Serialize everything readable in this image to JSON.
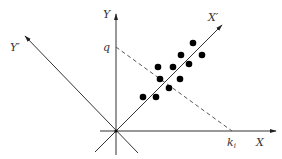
{
  "diagram": {
    "title": "",
    "colors": {
      "axis": "#333333",
      "points": "#000000",
      "dashed": "#555555",
      "background": "#ffffff"
    },
    "labels": {
      "y_axis": "Y",
      "x_axis": "X",
      "x_prime_axis": "X′",
      "y_prime_axis": "Y′",
      "q_label": "q",
      "k_label": "k",
      "k_subscript": "i"
    },
    "points_count": 11
  }
}
